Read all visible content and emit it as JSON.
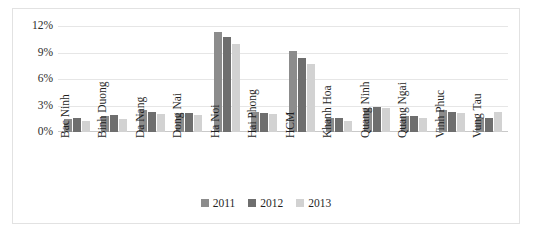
{
  "chart_data": {
    "type": "bar",
    "title": "",
    "subtitle": "",
    "xlabel": "",
    "ylabel": "",
    "ylim": [
      0,
      12
    ],
    "yticks": [
      "0%",
      "3%",
      "6%",
      "9%",
      "12%"
    ],
    "ytick_values": [
      0,
      3,
      6,
      9,
      12
    ],
    "grid": true,
    "legend_position": "bottom",
    "value_unit": "%",
    "categories": [
      "Bac Ninh",
      "Binh Duong",
      "Da Nang",
      "Dong Nai",
      "Ha Noi",
      "Hai Phong",
      "HCM",
      "Khanh Hoa",
      "Quang Ninh",
      "Quang Ngai",
      "Vinh Phuc",
      "Vung Tau"
    ],
    "series": [
      {
        "name": "2011",
        "color": "#8c8c8c",
        "values": [
          1.5,
          1.8,
          2.5,
          2.2,
          11.3,
          2.3,
          9.2,
          1.6,
          2.7,
          1.8,
          2.5,
          1.6
        ]
      },
      {
        "name": "2012",
        "color": "#6e6e6e",
        "values": [
          1.6,
          1.9,
          2.3,
          2.2,
          10.7,
          2.2,
          8.4,
          1.6,
          2.8,
          1.8,
          2.3,
          1.6
        ]
      },
      {
        "name": "2013",
        "color": "#d2d2d2",
        "values": [
          1.3,
          1.5,
          2.0,
          1.9,
          10.0,
          2.0,
          7.7,
          1.3,
          2.7,
          1.6,
          2.2,
          2.3
        ]
      }
    ]
  },
  "legend": {
    "items": [
      {
        "label": "2011"
      },
      {
        "label": "2012"
      },
      {
        "label": "2013"
      }
    ]
  }
}
